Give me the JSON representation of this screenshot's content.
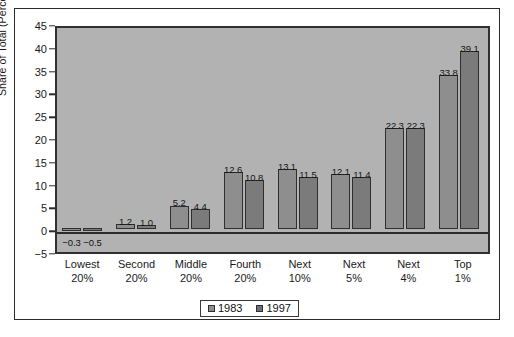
{
  "chart_data": {
    "type": "bar",
    "title": "",
    "xlabel": "",
    "ylabel": "Share of Total (Percent)",
    "ylim": [
      -5,
      45
    ],
    "ytick_step": 5,
    "yticks": [
      45,
      40,
      35,
      30,
      25,
      20,
      15,
      10,
      5,
      0,
      -5
    ],
    "ytick_labels": [
      "45",
      "40",
      "35",
      "30",
      "25",
      "20",
      "15",
      "10",
      "5",
      "0",
      "−5"
    ],
    "grid": false,
    "legend_position": "bottom",
    "categories": [
      "Lowest 20%",
      "Second 20%",
      "Middle 20%",
      "Fourth 20%",
      "Next 10%",
      "Next 5%",
      "Next 4%",
      "Top 1%"
    ],
    "category_lines": [
      [
        "Lowest",
        "20%"
      ],
      [
        "Second",
        "20%"
      ],
      [
        "Middle",
        "20%"
      ],
      [
        "Fourth",
        "20%"
      ],
      [
        "Next",
        "10%"
      ],
      [
        "Next",
        "5%"
      ],
      [
        "Next",
        "4%"
      ],
      [
        "Top",
        "1%"
      ]
    ],
    "series": [
      {
        "name": "1983",
        "color": "#8e8e8e",
        "values": [
          -0.3,
          1.2,
          5.2,
          12.6,
          13.1,
          12.1,
          22.3,
          33.8
        ],
        "labels": [
          "−0.3",
          "1.2",
          "5.2",
          "12.6",
          "13.1",
          "12.1",
          "22.3",
          "33.8"
        ]
      },
      {
        "name": "1997",
        "color": "#7b7b7b",
        "values": [
          -0.5,
          1.0,
          4.4,
          10.8,
          11.5,
          11.4,
          22.3,
          39.1
        ],
        "labels": [
          "−0.5",
          "1.0",
          "4.4",
          "10.8",
          "11.5",
          "11.4",
          "22.3",
          "39.1"
        ]
      }
    ]
  },
  "legend": {
    "items": [
      {
        "label": "1983",
        "color": "#8e8e8e"
      },
      {
        "label": "1997",
        "color": "#6f6f6f"
      }
    ]
  },
  "colors": {
    "plot_background": "#b2b2b2",
    "page_background": "#ffffff",
    "axis": "#2b2b2b",
    "series_1983": "#8e8e8e",
    "series_1997": "#7b7b7b"
  }
}
